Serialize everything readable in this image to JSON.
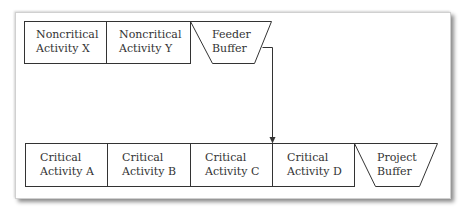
{
  "diagram": {
    "type": "critical-chain-buffer-diagram",
    "colors": {
      "line": "#333333",
      "text": "#333333",
      "background": "#ffffff"
    },
    "feeding_chain": [
      {
        "id": "noncritical-x",
        "line1": "Noncritical",
        "line2": "Activity X",
        "shape": "rectangle"
      },
      {
        "id": "noncritical-y",
        "line1": "Noncritical",
        "line2": "Activity Y",
        "shape": "rectangle"
      },
      {
        "id": "feeder-buffer",
        "line1": "Feeder",
        "line2": "Buffer",
        "shape": "trapezoid"
      }
    ],
    "critical_chain": [
      {
        "id": "critical-a",
        "line1": "Critical",
        "line2": "Activity A",
        "shape": "rectangle"
      },
      {
        "id": "critical-b",
        "line1": "Critical",
        "line2": "Activity B",
        "shape": "rectangle"
      },
      {
        "id": "critical-c",
        "line1": "Critical",
        "line2": "Activity C",
        "shape": "rectangle"
      },
      {
        "id": "critical-d",
        "line1": "Critical",
        "line2": "Activity D",
        "shape": "rectangle"
      },
      {
        "id": "project-buffer",
        "line1": "Project",
        "line2": "Buffer",
        "shape": "trapezoid"
      }
    ],
    "connections": [
      {
        "from": "feeder-buffer",
        "to": "critical-c/critical-d boundary",
        "arrow": true
      }
    ]
  }
}
